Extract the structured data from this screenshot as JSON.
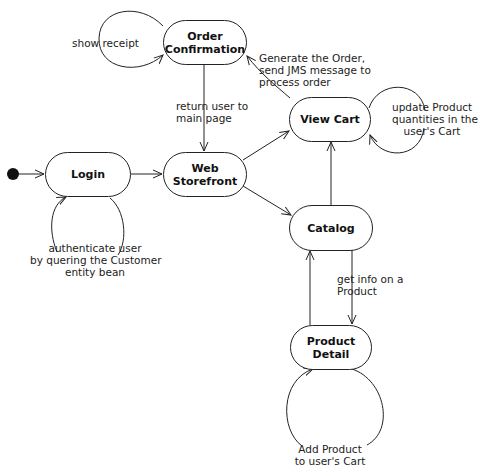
{
  "diagram": {
    "type": "state-machine",
    "initial_state": "Login",
    "states": [
      {
        "id": "order_confirmation",
        "label_line1": "Order",
        "label_line2": "Confirmation"
      },
      {
        "id": "view_cart",
        "label": "View Cart"
      },
      {
        "id": "login",
        "label": "Login"
      },
      {
        "id": "web_storefront",
        "label_line1": "Web",
        "label_line2": "Storefront"
      },
      {
        "id": "catalog",
        "label": "Catalog"
      },
      {
        "id": "product_detail",
        "label": "Product Detail"
      }
    ],
    "transitions": [
      {
        "from": "initial",
        "to": "Login",
        "label": ""
      },
      {
        "from": "Login",
        "to": "Login",
        "label_lines": [
          "authenticate user",
          "by quering the Customer",
          "entity bean"
        ]
      },
      {
        "from": "Login",
        "to": "Web Storefront",
        "label": ""
      },
      {
        "from": "Order Confirmation",
        "to": "Order Confirmation",
        "label": "show receipt"
      },
      {
        "from": "Order Confirmation",
        "to": "Web Storefront",
        "label_lines": [
          "return user to",
          "main page"
        ]
      },
      {
        "from": "View Cart",
        "to": "Order Confirmation",
        "label_lines": [
          "Generate the Order,",
          "send JMS message to",
          "process order"
        ]
      },
      {
        "from": "View Cart",
        "to": "View Cart",
        "label_lines": [
          "update Product",
          "quantities in the",
          "user's Cart"
        ]
      },
      {
        "from": "Web Storefront",
        "to": "View Cart",
        "label": ""
      },
      {
        "from": "Web Storefront",
        "to": "Catalog",
        "label": ""
      },
      {
        "from": "Catalog",
        "to": "View Cart",
        "label": ""
      },
      {
        "from": "Catalog",
        "to": "Product Detail",
        "label_lines": [
          "get info on a",
          "Product"
        ]
      },
      {
        "from": "Product Detail",
        "to": "Catalog",
        "label": ""
      },
      {
        "from": "Product Detail",
        "to": "Product Detail",
        "label_lines": [
          "Add Product",
          "to user's Cart"
        ]
      }
    ]
  },
  "labels": {
    "show_receipt": "show receipt",
    "return_user": [
      "return user to",
      "main page"
    ],
    "generate_order": [
      "Generate the Order,",
      "send JMS message to",
      "process order"
    ],
    "update_cart": [
      "update Product",
      "quantities in the",
      "user's Cart"
    ],
    "authenticate": [
      "authenticate user",
      "by quering the Customer",
      "entity bean"
    ],
    "get_info": [
      "get info on a",
      "Product"
    ],
    "add_product": [
      "Add Product",
      "to user's Cart"
    ]
  },
  "colors": {
    "stroke": "#222222",
    "background": "#ffffff",
    "text": "#111111"
  }
}
